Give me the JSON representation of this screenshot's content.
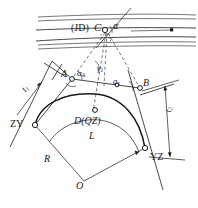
{
  "figure": {
    "type": "surveying-circular-curve-diagram",
    "ink_color": "#1a1a1a",
    "background": "#ffffff"
  },
  "labels": {
    "jd": "(JD)",
    "c": "C",
    "alpha": "α",
    "point_a": "A",
    "alpha_a_base": "α",
    "alpha_a_sub": "A",
    "gamma_base": "γ",
    "gamma_sub": "1",
    "point_b": "B",
    "alpha_b_base": "α",
    "alpha_b_sub": "B",
    "alpha_s_base": "a",
    "alpha_s_sub": "s",
    "zy": "ZY",
    "yz": "YZ",
    "d_qz": "D(QZ)",
    "curve_length": "L",
    "radius": "R",
    "center_o": "O",
    "t1_base": "t",
    "t1_sub": "1",
    "t2_base": "t",
    "t2_sub": "2"
  },
  "label_positions": {
    "jd": {
      "x": 71,
      "y": 24
    },
    "c": {
      "x": 96,
      "y": 23
    },
    "alpha": {
      "x": 114,
      "y": 21
    },
    "point_a": {
      "x": 62,
      "y": 70
    },
    "alpha_a": {
      "x": 77,
      "y": 70
    },
    "gamma": {
      "x": 98,
      "y": 66
    },
    "alpha_s": {
      "x": 115,
      "y": 79
    },
    "point_b": {
      "x": 144,
      "y": 80
    },
    "zy": {
      "x": 11,
      "y": 124
    },
    "yz": {
      "x": 152,
      "y": 160
    },
    "d_qz": {
      "x": 76,
      "y": 120
    },
    "curve_length": {
      "x": 90,
      "y": 135
    },
    "radius": {
      "x": 45,
      "y": 158
    },
    "center_o": {
      "x": 77,
      "y": 185
    },
    "t1": {
      "x": 22,
      "y": 92
    },
    "t2": {
      "x": 166,
      "y": 118
    }
  }
}
